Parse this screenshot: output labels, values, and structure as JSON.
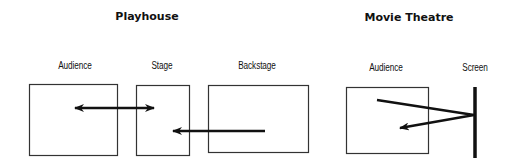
{
  "playhouse": {
    "title": "Playhouse",
    "labels": {
      "audience": "Audience",
      "stage": "Stage",
      "backstage": "Backstage"
    }
  },
  "movie_theatre": {
    "title": "Movie Theatre",
    "labels": {
      "audience": "Audience",
      "screen": "Screen"
    }
  },
  "colors": {
    "stroke": "#111111",
    "box_stroke": "#333333",
    "background": "#ffffff"
  }
}
